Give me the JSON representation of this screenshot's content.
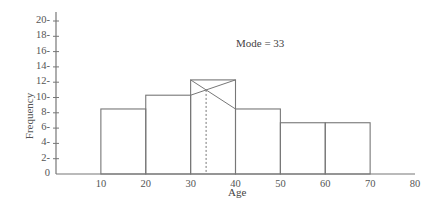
{
  "chart_data": {
    "type": "bar",
    "subtype": "histogram",
    "title": "",
    "xlabel": "Age",
    "ylabel": "Frequency",
    "annotation": "Mode = 33",
    "bins": [
      [
        10,
        20
      ],
      [
        20,
        30
      ],
      [
        30,
        40
      ],
      [
        40,
        50
      ],
      [
        50,
        60
      ],
      [
        60,
        70
      ]
    ],
    "categories": [
      "10-20",
      "20-30",
      "30-40",
      "40-50",
      "50-60",
      "60-70"
    ],
    "values": [
      8.5,
      10.3,
      12.3,
      8.5,
      6.7,
      6.7
    ],
    "modal_class": [
      30,
      40
    ],
    "mode": 33,
    "xlim": [
      0,
      80
    ],
    "ylim": [
      0,
      20
    ],
    "x_ticks": [
      "10",
      "20",
      "30",
      "40",
      "50",
      "60",
      "70",
      "80"
    ],
    "y_ticks": [
      "0",
      "2-",
      "4-",
      "6-",
      "8-",
      "10-",
      "12-",
      "14-",
      "16-",
      "18-",
      "20-"
    ],
    "grid": false,
    "legend": null
  },
  "colors": {
    "line": "#777777",
    "text": "#555555"
  }
}
